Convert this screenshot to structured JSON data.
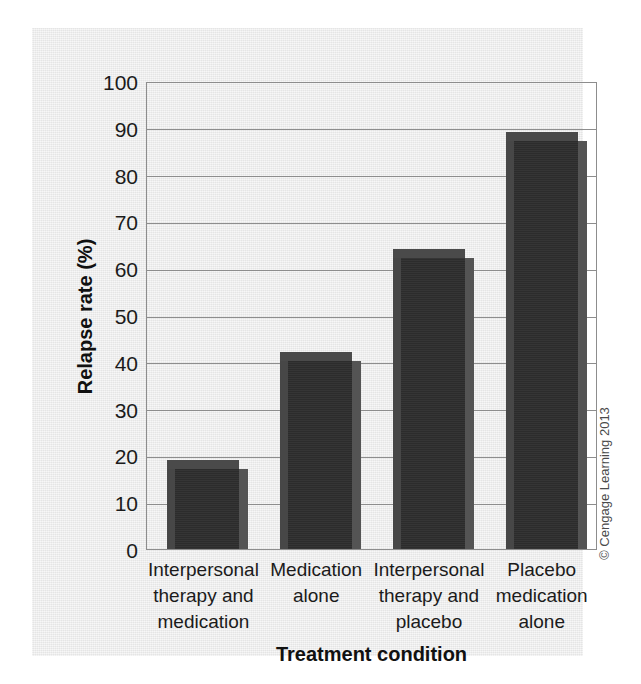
{
  "chart_data": {
    "type": "bar",
    "title": "",
    "categories": [
      "Interpersonal therapy and medication",
      "Medication alone",
      "Interpersonal therapy and placebo",
      "Placebo medication alone"
    ],
    "category_lines": [
      [
        "Interpersonal",
        "therapy and",
        "medication"
      ],
      [
        "Medication",
        "alone"
      ],
      [
        "Interpersonal",
        "therapy and",
        "placebo"
      ],
      [
        "Placebo",
        "medication",
        "alone"
      ]
    ],
    "values": [
      19,
      42,
      64,
      89
    ],
    "xlabel": "Treatment condition",
    "ylabel": "Relapse rate (%)",
    "ylim": [
      0,
      100
    ],
    "ytick_step": 10,
    "yticks": [
      0,
      10,
      20,
      30,
      40,
      50,
      60,
      70,
      80,
      90,
      100
    ],
    "ytick_labels": [
      "0",
      "10",
      "20",
      "30",
      "40",
      "50",
      "60",
      "70",
      "80",
      "90",
      "100"
    ],
    "grid": true,
    "grid_axis": "y",
    "legend": false,
    "bar_color": "#2e2e2e",
    "bar_top_color": "#4a4a4a",
    "bar_side_color": "#545454",
    "grid_color": "#8d8d8d",
    "panel_color": "#e9e9e9"
  },
  "credit": {
    "text": "© Cengage Learning 2013"
  }
}
